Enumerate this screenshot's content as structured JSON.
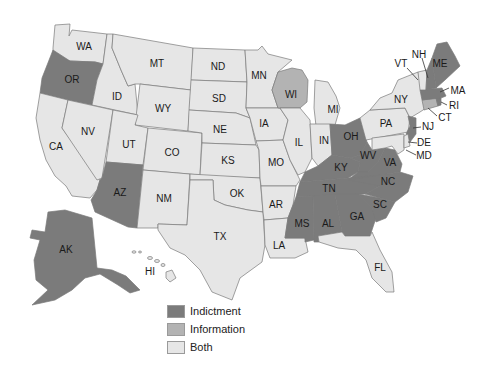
{
  "colors": {
    "indictment": "#7b7b7b",
    "information": "#b3b3b3",
    "both": "#e6e6e6",
    "border": "#7a7a7a"
  },
  "legend": [
    {
      "key": "indictment",
      "label": "Indictment"
    },
    {
      "key": "information",
      "label": "Information"
    },
    {
      "key": "both",
      "label": "Both"
    }
  ],
  "states": {
    "WA": {
      "label": "WA",
      "category": "both"
    },
    "OR": {
      "label": "OR",
      "category": "indictment"
    },
    "CA": {
      "label": "CA",
      "category": "both"
    },
    "ID": {
      "label": "ID",
      "category": "both"
    },
    "NV": {
      "label": "NV",
      "category": "both"
    },
    "MT": {
      "label": "MT",
      "category": "both"
    },
    "WY": {
      "label": "WY",
      "category": "both"
    },
    "UT": {
      "label": "UT",
      "category": "both"
    },
    "AZ": {
      "label": "AZ",
      "category": "indictment"
    },
    "CO": {
      "label": "CO",
      "category": "both"
    },
    "NM": {
      "label": "NM",
      "category": "both"
    },
    "ND": {
      "label": "ND",
      "category": "both"
    },
    "SD": {
      "label": "SD",
      "category": "both"
    },
    "NE": {
      "label": "NE",
      "category": "both"
    },
    "KS": {
      "label": "KS",
      "category": "both"
    },
    "OK": {
      "label": "OK",
      "category": "both"
    },
    "TX": {
      "label": "TX",
      "category": "both"
    },
    "MN": {
      "label": "MN",
      "category": "both"
    },
    "IA": {
      "label": "IA",
      "category": "both"
    },
    "MO": {
      "label": "MO",
      "category": "both"
    },
    "AR": {
      "label": "AR",
      "category": "both"
    },
    "LA": {
      "label": "LA",
      "category": "both"
    },
    "WI": {
      "label": "WI",
      "category": "information"
    },
    "IL": {
      "label": "IL",
      "category": "both"
    },
    "MI": {
      "label": "MI",
      "category": "both"
    },
    "IN": {
      "label": "IN",
      "category": "both"
    },
    "OH": {
      "label": "OH",
      "category": "indictment"
    },
    "KY": {
      "label": "KY",
      "category": "indictment"
    },
    "TN": {
      "label": "TN",
      "category": "indictment"
    },
    "MS": {
      "label": "MS",
      "category": "indictment"
    },
    "AL": {
      "label": "AL",
      "category": "indictment"
    },
    "GA": {
      "label": "GA",
      "category": "indictment"
    },
    "FL": {
      "label": "FL",
      "category": "both"
    },
    "SC": {
      "label": "SC",
      "category": "indictment"
    },
    "NC": {
      "label": "NC",
      "category": "indictment"
    },
    "VA": {
      "label": "VA",
      "category": "indictment"
    },
    "WV": {
      "label": "WV",
      "category": "indictment"
    },
    "PA": {
      "label": "PA",
      "category": "both"
    },
    "NY": {
      "label": "NY",
      "category": "both"
    },
    "NJ": {
      "label": "NJ",
      "category": "indictment"
    },
    "DE": {
      "label": "DE",
      "category": "both"
    },
    "MD": {
      "label": "MD",
      "category": "both"
    },
    "CT": {
      "label": "CT",
      "category": "information"
    },
    "RI": {
      "label": "RI",
      "category": "indictment"
    },
    "MA": {
      "label": "MA",
      "category": "indictment"
    },
    "VT": {
      "label": "VT",
      "category": "both"
    },
    "NH": {
      "label": "NH",
      "category": "indictment"
    },
    "ME": {
      "label": "ME",
      "category": "indictment"
    },
    "AK": {
      "label": "AK",
      "category": "indictment"
    },
    "HI": {
      "label": "HI",
      "category": "both"
    }
  }
}
